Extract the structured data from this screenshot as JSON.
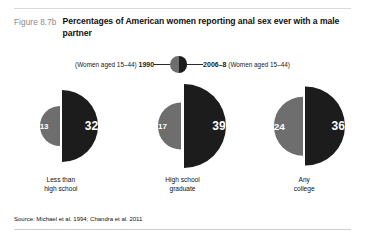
{
  "figure": {
    "label": "Figure 8.7b",
    "title": "Percentages of American women reporting anal sex ever with a male partner",
    "source": "Source: Michael et al. 1994; Chandra et al. 2011"
  },
  "legend": {
    "left_text": "(Women aged 15–44)",
    "left_year": "1990",
    "right_year": "2006–8",
    "right_text": "(Women aged 15–44)",
    "left_color": "#6e6e6e",
    "right_color": "#1c1c1c",
    "icon": "split-circle-icon"
  },
  "chart_data": {
    "type": "bar",
    "title": "Percentages of American women reporting anal sex ever with a male partner",
    "xlabel": "",
    "ylabel": "Percent",
    "categories": [
      "Less than high school",
      "High school graduate",
      "Any college"
    ],
    "series": [
      {
        "name": "1990",
        "values": [
          13,
          17,
          24
        ],
        "color": "#6e6e6e"
      },
      {
        "name": "2006–8",
        "values": [
          32,
          39,
          36
        ],
        "color": "#1c1c1c"
      }
    ],
    "value_labels": [
      [
        "13",
        "32"
      ],
      [
        "17",
        "39"
      ],
      [
        "24",
        "36"
      ]
    ],
    "ylim": [
      0,
      40
    ],
    "grid": false,
    "legend_position": "top-center",
    "glyph": "paired-half-circles-scaled-by-value"
  },
  "categories_display": [
    {
      "line1": "Less than",
      "line2": "high school"
    },
    {
      "line1": "High school",
      "line2": "graduate"
    },
    {
      "line1": "Any",
      "line2": "college"
    }
  ]
}
